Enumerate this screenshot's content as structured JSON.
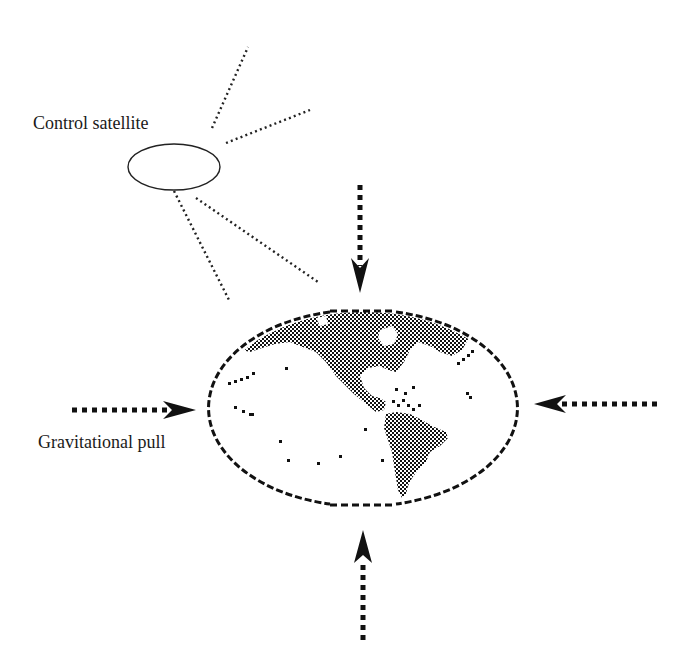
{
  "diagram": {
    "type": "concept-illustration",
    "labels": {
      "satellite": "Control satellite",
      "gravity": "Gravitational pull"
    },
    "colors": {
      "ink": "#111111",
      "background": "#ffffff",
      "text": "#1a1a1a"
    },
    "satellite": {
      "shape": "ellipse",
      "cx": 174,
      "cy": 167,
      "rx": 46,
      "ry": 23,
      "rays": [
        {
          "x1": 212,
          "y1": 128,
          "x2": 248,
          "y2": 47
        },
        {
          "x1": 226,
          "y1": 143,
          "x2": 310,
          "y2": 110
        },
        {
          "x1": 174,
          "y1": 191,
          "x2": 229,
          "y2": 300
        },
        {
          "x1": 196,
          "y1": 198,
          "x2": 318,
          "y2": 282
        }
      ]
    },
    "globe": {
      "shape": "pixelated-ellipse",
      "cx": 364,
      "cy": 408,
      "rx": 152,
      "ry": 98,
      "region_shown": "Western hemisphere (North and South America)"
    },
    "arrows": [
      {
        "name": "arrow-from-top",
        "direction": "down",
        "tail": [
          360,
          185
        ],
        "tip": [
          360,
          293
        ]
      },
      {
        "name": "arrow-from-bottom",
        "direction": "up",
        "tail": [
          363,
          645
        ],
        "tip": [
          363,
          530
        ]
      },
      {
        "name": "arrow-from-left",
        "direction": "right",
        "tail": [
          72,
          410
        ],
        "tip": [
          196,
          410
        ]
      },
      {
        "name": "arrow-from-right",
        "direction": "left",
        "tail": [
          657,
          404
        ],
        "tip": [
          535,
          404
        ]
      }
    ]
  }
}
